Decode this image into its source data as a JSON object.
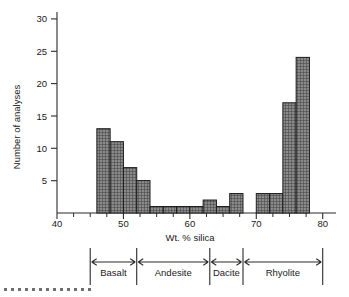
{
  "chart_data": {
    "type": "bar",
    "title": "",
    "subtitle": "",
    "xlabel": "Wt. % silica",
    "ylabel": "Number of analyses",
    "xlim": [
      40,
      82
    ],
    "ylim": [
      0,
      31
    ],
    "grid": false,
    "legend_position": "below-axis",
    "bin_width": 2,
    "x_ticks_major": [
      40,
      50,
      60,
      70,
      80
    ],
    "x_ticks_major_labels": [
      "40",
      "50",
      "60",
      "70",
      "80"
    ],
    "x_minor_tick_step": 2.5,
    "y_ticks_major": [
      5,
      10,
      15,
      20,
      25,
      30
    ],
    "y_ticks_major_labels": [
      "5",
      "10",
      "15",
      "20",
      "25",
      "30"
    ],
    "bin_edges": [
      46,
      48,
      50,
      52,
      54,
      56,
      58,
      60,
      62,
      64,
      66,
      68,
      70,
      72,
      74,
      76,
      78
    ],
    "categories": [
      "46-48",
      "48-50",
      "50-52",
      "52-54",
      "54-56",
      "56-58",
      "58-60",
      "60-62",
      "62-64",
      "64-66",
      "66-68",
      "68-70",
      "70-72",
      "72-74",
      "74-76",
      "76-78"
    ],
    "values": [
      13,
      11,
      7,
      5,
      1,
      1,
      1,
      1,
      2,
      1,
      3,
      0,
      3,
      3,
      17,
      24
    ],
    "bar_fill_color": "#8a8a8a",
    "bar_edge_color": "#1d1d1d",
    "axis_color": "#2b2b2b",
    "rock_classes": [
      {
        "label": "Basalt",
        "start": 45,
        "end": 52
      },
      {
        "label": "Andesite",
        "start": 52,
        "end": 63
      },
      {
        "label": "Dacite",
        "start": 63,
        "end": 68
      },
      {
        "label": "Rhyolite",
        "start": 68,
        "end": 80
      }
    ]
  },
  "footer": {
    "dot_count": 13,
    "dot_color": "#6f6f6f"
  }
}
